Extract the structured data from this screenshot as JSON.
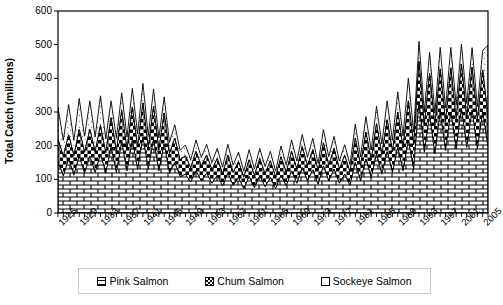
{
  "chart_data": {
    "type": "area",
    "stacked": true,
    "title": "",
    "xlabel": "",
    "ylabel": "Total Catch (millions)",
    "ylim": [
      0,
      600
    ],
    "yticks": [
      0,
      100,
      200,
      300,
      400,
      500,
      600
    ],
    "grid": false,
    "legend_position": "bottom",
    "xlim": [
      1925,
      2006
    ],
    "xtick_step": 4,
    "x": [
      1925,
      1926,
      1927,
      1928,
      1929,
      1930,
      1931,
      1932,
      1933,
      1934,
      1935,
      1936,
      1937,
      1938,
      1939,
      1940,
      1941,
      1942,
      1943,
      1944,
      1945,
      1946,
      1947,
      1948,
      1949,
      1950,
      1951,
      1952,
      1953,
      1954,
      1955,
      1956,
      1957,
      1958,
      1959,
      1960,
      1961,
      1962,
      1963,
      1964,
      1965,
      1966,
      1967,
      1968,
      1969,
      1970,
      1971,
      1972,
      1973,
      1974,
      1975,
      1976,
      1977,
      1978,
      1979,
      1980,
      1981,
      1982,
      1983,
      1984,
      1985,
      1986,
      1987,
      1988,
      1989,
      1990,
      1991,
      1992,
      1993,
      1994,
      1995,
      1996,
      1997,
      1998,
      1999,
      2000,
      2001,
      2002,
      2003,
      2004,
      2005,
      2006
    ],
    "xticks": [
      1925,
      1929,
      1933,
      1937,
      1941,
      1945,
      1949,
      1953,
      1957,
      1961,
      1965,
      1969,
      1973,
      1977,
      1981,
      1985,
      1989,
      1993,
      1997,
      2001,
      2005
    ],
    "series": [
      {
        "name": "Pink Salmon",
        "pattern": "brick",
        "values": [
          150,
          110,
          160,
          112,
          170,
          118,
          168,
          120,
          175,
          118,
          195,
          120,
          210,
          125,
          215,
          130,
          225,
          130,
          218,
          125,
          205,
          118,
          150,
          108,
          115,
          92,
          125,
          95,
          118,
          88,
          112,
          80,
          118,
          82,
          105,
          72,
          108,
          75,
          110,
          78,
          105,
          72,
          112,
          80,
          125,
          88,
          135,
          95,
          128,
          85,
          140,
          95,
          130,
          88,
          115,
          82,
          150,
          95,
          160,
          105,
          175,
          115,
          182,
          120,
          195,
          125,
          215,
          130,
          330,
          180,
          290,
          175,
          300,
          185,
          300,
          190,
          310,
          195,
          305,
          190,
          300,
          195
        ]
      },
      {
        "name": "Chum Salmon",
        "pattern": "checker",
        "values": [
          70,
          58,
          72,
          58,
          78,
          62,
          80,
          62,
          85,
          60,
          88,
          62,
          95,
          62,
          100,
          65,
          102,
          62,
          98,
          62,
          92,
          58,
          72,
          50,
          55,
          42,
          58,
          44,
          54,
          40,
          50,
          36,
          54,
          38,
          48,
          34,
          50,
          36,
          52,
          38,
          50,
          34,
          55,
          40,
          58,
          42,
          62,
          45,
          60,
          40,
          68,
          46,
          62,
          42,
          56,
          40,
          72,
          46,
          80,
          52,
          90,
          58,
          95,
          62,
          105,
          68,
          118,
          72,
          120,
          80,
          125,
          82,
          128,
          85,
          130,
          88,
          132,
          88,
          128,
          86,
          125,
          88
        ]
      },
      {
        "name": "Sockeye Salmon",
        "pattern": "dots",
        "values": [
          95,
          48,
          90,
          46,
          92,
          48,
          85,
          44,
          88,
          42,
          50,
          40,
          52,
          38,
          55,
          40,
          58,
          38,
          52,
          36,
          48,
          34,
          40,
          28,
          32,
          24,
          34,
          26,
          32,
          22,
          30,
          20,
          32,
          22,
          28,
          18,
          30,
          20,
          30,
          22,
          28,
          18,
          32,
          22,
          34,
          24,
          36,
          26,
          34,
          22,
          40,
          26,
          36,
          24,
          32,
          22,
          42,
          26,
          46,
          30,
          52,
          32,
          56,
          34,
          60,
          36,
          68,
          38,
          60,
          40,
          62,
          40,
          64,
          42,
          62,
          42,
          60,
          42,
          58,
          40,
          58,
          215
        ]
      }
    ]
  },
  "axis": {
    "y_labels": [
      "600",
      "500",
      "400",
      "300",
      "200",
      "100",
      "0"
    ],
    "y_title": "Total Catch (millions)",
    "x_labels": [
      "1925",
      "1929",
      "1933",
      "1937",
      "1941",
      "1945",
      "1949",
      "1953",
      "1957",
      "1961",
      "1965",
      "1969",
      "1973",
      "1977",
      "1981",
      "1985",
      "1989",
      "1993",
      "1997",
      "2001",
      "2005"
    ]
  },
  "legend": {
    "items": [
      {
        "label": "Pink Salmon",
        "swatch": "brick-swatch"
      },
      {
        "label": "Chum Salmon",
        "swatch": "checker-swatch"
      },
      {
        "label": "Sockeye Salmon",
        "swatch": "dots-swatch"
      }
    ]
  },
  "colors": {
    "axis": "#000000",
    "fill": "#ffffff",
    "pattern_stroke": "#000000",
    "legend_border": "#c9c9c9"
  }
}
